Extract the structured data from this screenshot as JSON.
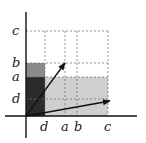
{
  "diagram": {
    "y_labels": {
      "c": "c",
      "b": "b",
      "a": "a",
      "d": "d"
    },
    "x_labels": {
      "d": "d",
      "a": "a",
      "b": "b",
      "c": "c"
    },
    "colors": {
      "dark_region": "#2b2b2b",
      "mid_region": "#8a8a8a",
      "light_region": "#cfcfcf",
      "axis": "#111111",
      "grid": "#777777",
      "arrow": "#111111"
    }
  }
}
